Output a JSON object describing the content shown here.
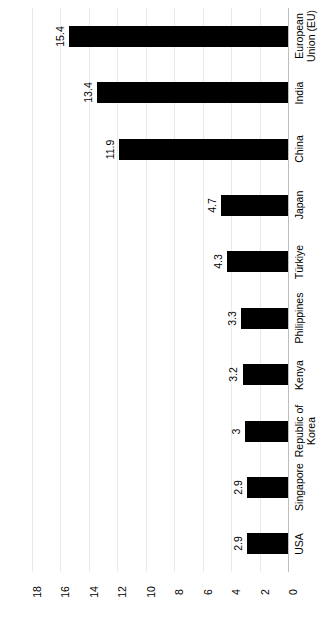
{
  "chart_data": {
    "type": "bar",
    "orientation": "horizontal",
    "title": "(RM15,956.34 million), 2022",
    "xlabel": "",
    "ylabel": "",
    "grid": true,
    "legend": "none",
    "xlim": [
      0,
      18
    ],
    "xticks": [
      "0",
      "2",
      "4",
      "6",
      "8",
      "10",
      "12",
      "14",
      "16",
      "18"
    ],
    "categories": [
      "European\nUnion (EU)",
      "India",
      "China",
      "Japan",
      "Türkiye",
      "Philippines",
      "Kenya",
      "Republic of\nKorea",
      "Singapore",
      "USA"
    ],
    "values": [
      15.4,
      13.4,
      11.9,
      4.7,
      4.3,
      3.3,
      3.2,
      3,
      2.9,
      2.9
    ],
    "value_labels": [
      "15.4",
      "13.4",
      "11.9",
      "4.7",
      "4.3",
      "3.3",
      "3.2",
      "3",
      "2.9",
      "2.9"
    ],
    "bar_color": "#000000",
    "gridline_color": "#e9e9e9",
    "axis_color": "#bdbdbd",
    "background_color": "#ffffff"
  }
}
